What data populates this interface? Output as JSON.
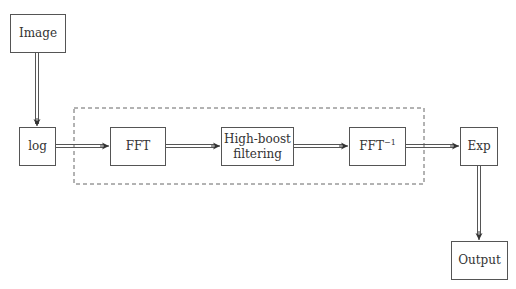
{
  "diagram": {
    "nodes": {
      "image": {
        "label": "Image"
      },
      "log": {
        "label": "log"
      },
      "fft": {
        "label": "FFT"
      },
      "highboost": {
        "label_line1": "High-boost",
        "label_line2": "filtering"
      },
      "ifft": {
        "label": "FFT",
        "superscript": "−1"
      },
      "exp": {
        "label": "Exp"
      },
      "output": {
        "label": "Output"
      }
    },
    "edges": [
      {
        "from": "Image",
        "to": "log"
      },
      {
        "from": "log",
        "to": "FFT"
      },
      {
        "from": "FFT",
        "to": "High-boost filtering"
      },
      {
        "from": "High-boost filtering",
        "to": "FFT−1"
      },
      {
        "from": "FFT−1",
        "to": "Exp"
      },
      {
        "from": "Exp",
        "to": "Output"
      }
    ],
    "group": {
      "style": "dashed",
      "contains": [
        "FFT",
        "High-boost filtering",
        "FFT−1"
      ]
    },
    "colors": {
      "stroke": "#555555",
      "dashed": "#666666",
      "text": "#333333",
      "background": "#ffffff"
    }
  }
}
